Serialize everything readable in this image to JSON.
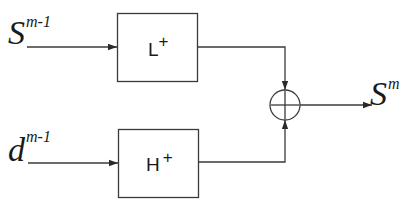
{
  "diagram": {
    "type": "block-diagram",
    "inputs": [
      {
        "id": "s-input",
        "base": "S",
        "superscript": "m-1"
      },
      {
        "id": "d-input",
        "base": "d",
        "superscript": "m-1"
      }
    ],
    "blocks": [
      {
        "id": "lowpass-synthesis",
        "label": "L",
        "superscript": "+"
      },
      {
        "id": "highpass-synthesis",
        "label": "H",
        "superscript": "+"
      }
    ],
    "summing_junction": {
      "id": "adder",
      "symbol": "+"
    },
    "output": {
      "id": "s-output",
      "base": "S",
      "superscript": "m"
    },
    "edges": [
      {
        "from": "s-input",
        "to": "lowpass-synthesis"
      },
      {
        "from": "d-input",
        "to": "highpass-synthesis"
      },
      {
        "from": "lowpass-synthesis",
        "to": "adder"
      },
      {
        "from": "highpass-synthesis",
        "to": "adder"
      },
      {
        "from": "adder",
        "to": "s-output"
      }
    ]
  },
  "colors": {
    "stroke": "#3a3a3a",
    "text": "#1a1a1a",
    "background": "#ffffff"
  }
}
